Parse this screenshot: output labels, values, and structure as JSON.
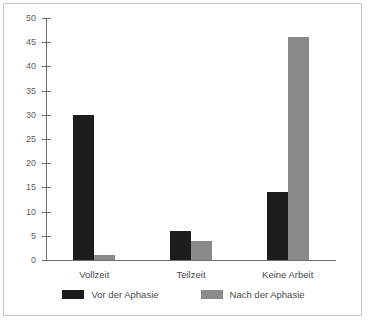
{
  "chart_data": {
    "type": "bar",
    "title": "",
    "subtitle": "",
    "xlabel": "",
    "ylabel": "",
    "categories": [
      "Vollzeit",
      "Teilzeit",
      "Keine Arbeit"
    ],
    "series": [
      {
        "name": "Vor der Aphasie",
        "color": "#1c1c1c",
        "values": [
          30,
          6,
          14
        ]
      },
      {
        "name": "Nach der Aphasie",
        "color": "#8a8a8a",
        "values": [
          1,
          4,
          46
        ]
      }
    ],
    "ylim": [
      0,
      50
    ],
    "ytick_step": 5,
    "yticks": [
      0,
      5,
      10,
      15,
      20,
      25,
      30,
      35,
      40,
      45,
      50
    ],
    "ytick_labels": [
      "0",
      "5",
      "10",
      "15",
      "20",
      "25",
      "30",
      "35",
      "40",
      "45",
      "50"
    ],
    "grid": false,
    "legend_position": "bottom",
    "frame": true
  }
}
